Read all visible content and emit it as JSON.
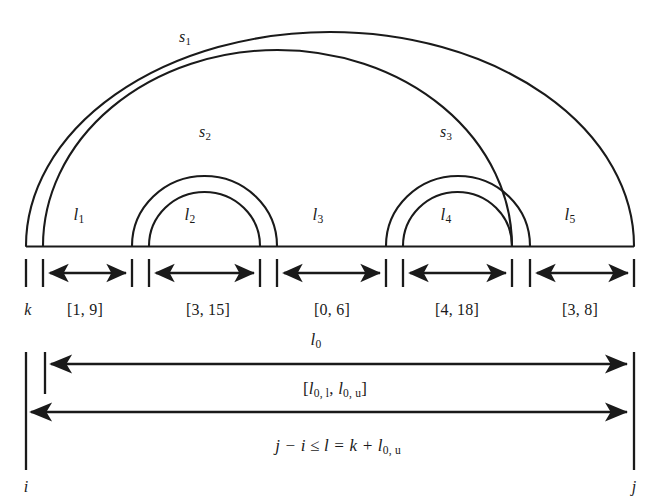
{
  "figure": {
    "type": "arc-diagram",
    "baseline": {
      "y": 246,
      "x_start": 26,
      "x_end": 634
    },
    "arc_labels": [
      {
        "name": "s1",
        "base": "s",
        "sub": "1",
        "x": 185,
        "y": 38
      },
      {
        "name": "s2",
        "base": "s",
        "sub": "2",
        "x": 205,
        "y": 133
      },
      {
        "name": "s3",
        "base": "s",
        "sub": "3",
        "x": 446,
        "y": 133
      }
    ],
    "loop_labels": [
      {
        "name": "l1",
        "base": "l",
        "sub": "1",
        "x": 79,
        "y": 216
      },
      {
        "name": "l2",
        "base": "l",
        "sub": "2",
        "x": 190,
        "y": 216
      },
      {
        "name": "l3",
        "base": "l",
        "sub": "3",
        "x": 318,
        "y": 216
      },
      {
        "name": "l4",
        "base": "l",
        "sub": "4",
        "x": 446,
        "y": 216
      },
      {
        "name": "l5",
        "base": "l",
        "sub": "5",
        "x": 570,
        "y": 216
      }
    ],
    "arcs": [
      {
        "name": "s1-outer",
        "x1": 26,
        "x2": 634,
        "ry": 214
      },
      {
        "name": "s1-inner",
        "x1": 43,
        "x2": 512,
        "ry": 196
      },
      {
        "name": "s2-outer",
        "x1": 132,
        "x2": 277,
        "ry": 70
      },
      {
        "name": "s2-inner",
        "x1": 149,
        "x2": 260,
        "ry": 54
      },
      {
        "name": "s3-outer",
        "x1": 386,
        "x2": 530,
        "ry": 70
      },
      {
        "name": "s3-inner",
        "x1": 403,
        "x2": 512,
        "ry": 54
      }
    ],
    "tick_marks": [
      26,
      43,
      132,
      149,
      260,
      277,
      386,
      403,
      512,
      530,
      634
    ],
    "tick_row": {
      "y_top": 259,
      "y_bottom": 287
    },
    "interval_arrows": [
      {
        "name": "interval-arrow-1",
        "x1": 47,
        "x2": 128
      },
      {
        "name": "interval-arrow-2",
        "x1": 153,
        "x2": 256
      },
      {
        "name": "interval-arrow-3",
        "x1": 281,
        "x2": 382
      },
      {
        "name": "interval-arrow-4",
        "x1": 407,
        "x2": 508
      },
      {
        "name": "interval-arrow-5",
        "x1": 534,
        "x2": 630
      }
    ],
    "interval_labels": [
      {
        "name": "node-k",
        "text": "k",
        "x": 28,
        "y": 310,
        "italic": true
      },
      {
        "name": "interval-1",
        "text": "[1, 9]",
        "x": 85,
        "y": 310
      },
      {
        "name": "interval-2",
        "text": "[3, 15]",
        "x": 208,
        "y": 310
      },
      {
        "name": "interval-3",
        "text": "[0, 6]",
        "x": 332,
        "y": 310
      },
      {
        "name": "interval-4",
        "text": "[4, 18]",
        "x": 457,
        "y": 310
      },
      {
        "name": "interval-5",
        "text": "[3, 8]",
        "x": 580,
        "y": 310
      }
    ],
    "bottom": {
      "verticals": [
        {
          "name": "vertical-i",
          "x": 26,
          "y1": 352,
          "y2": 470
        },
        {
          "name": "vertical-k-short",
          "x": 45,
          "y1": 352,
          "y2": 394
        },
        {
          "name": "vertical-j",
          "x": 634,
          "y1": 352,
          "y2": 470
        }
      ],
      "arrow_l0": {
        "name": "l0-arrow",
        "x1": 48,
        "x2": 630,
        "y": 364
      },
      "arrow_range": {
        "name": "range-arrow",
        "x1": 28,
        "x2": 630,
        "y": 412
      },
      "label_l0": {
        "base": "l",
        "sub": "0",
        "x": 316,
        "y": 341
      },
      "label_range": {
        "x": 335,
        "y": 390
      },
      "label_formula": {
        "x": 338,
        "y": 447
      },
      "node_i": {
        "text": "i",
        "x": 26,
        "y": 487
      },
      "node_j": {
        "text": "j",
        "x": 634,
        "y": 487
      }
    },
    "colors": {
      "ink": "#1a1a1a",
      "background": "#ffffff"
    }
  },
  "text": {
    "l0_base": "l",
    "l0_sub": "0",
    "range_open": "[",
    "range_l_base": "l",
    "range_l_sub": "0, l",
    "range_comma": ", ",
    "range_u_base": "l",
    "range_u_sub": "0, u",
    "range_close": "]",
    "formula_part1": "j − i ≤ l = k + ",
    "formula_l_base": "l",
    "formula_l_sub": "0, u",
    "node_i": "i",
    "node_j": "j",
    "node_k": "k"
  }
}
